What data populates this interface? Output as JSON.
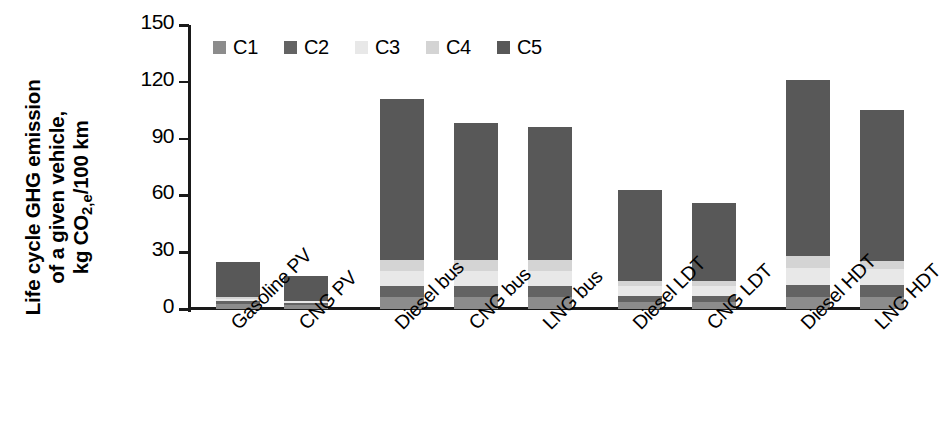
{
  "chart_data": {
    "type": "bar",
    "stacked": true,
    "title": "",
    "xlabel": "",
    "ylabel": "Life cycle GHG emission of a given vehicle, kg CO2,e/100 km",
    "ylabel_lines": [
      "Life cycle GHG emission",
      "of a given vehicle,",
      "kg CO"
    ],
    "ylabel_line3_prefix": "kg CO",
    "ylabel_line3_sub": "2,e",
    "ylabel_line3_suffix": "/100 km",
    "ylim": [
      0,
      150
    ],
    "yticks": [
      0,
      30,
      60,
      90,
      120,
      150
    ],
    "ytick_labels": [
      "0",
      "30",
      "60",
      "90",
      "120",
      "150"
    ],
    "grid": false,
    "legend_position": "top-left",
    "legend": [
      "C1",
      "C2",
      "C3",
      "C4",
      "C5"
    ],
    "colors": {
      "C1": "#8c8c8c",
      "C2": "#636363",
      "C3": "#e8e8e8",
      "C4": "#d4d4d4",
      "C5": "#585858",
      "axis": "#1a1a1a",
      "background": "#ffffff"
    },
    "categories": [
      "Gasoline PV",
      "CNG PV",
      "Diesel bus",
      "CNG bus",
      "LNG bus",
      "Diesel LDT",
      "CNG LDT",
      "Diesel HDT",
      "LNG HDT"
    ],
    "series": [
      {
        "name": "C1",
        "values": [
          2.5,
          2.0,
          6.5,
          6.5,
          6.5,
          3.5,
          3.5,
          6.5,
          6.5
        ]
      },
      {
        "name": "C2",
        "values": [
          1.5,
          1.0,
          5.5,
          5.5,
          5.5,
          3.5,
          3.5,
          6.0,
          6.0
        ]
      },
      {
        "name": "C3",
        "values": [
          1.5,
          1.0,
          8.0,
          8.0,
          8.0,
          5.0,
          5.0,
          9.0,
          8.5
        ]
      },
      {
        "name": "C4",
        "values": [
          1.0,
          0.5,
          6.0,
          6.0,
          6.0,
          3.0,
          3.0,
          6.5,
          4.5
        ]
      },
      {
        "name": "C5",
        "values": [
          18.5,
          13.0,
          85.0,
          72.0,
          70.0,
          48.0,
          41.0,
          93.0,
          79.5
        ]
      }
    ],
    "totals": [
      25,
      17.5,
      111,
      98,
      96,
      63,
      56,
      121,
      105
    ],
    "group_gaps_after": [
      "CNG PV",
      "LNG bus",
      "CNG LDT"
    ]
  }
}
